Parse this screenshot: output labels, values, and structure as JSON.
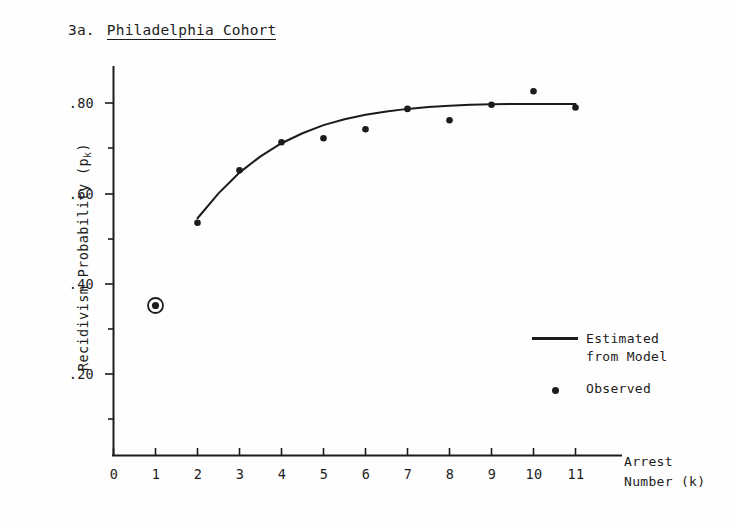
{
  "figure": {
    "number": "3a.",
    "name": "Philadelphia Cohort"
  },
  "axes": {
    "y_title_main": "Recidivism Probability (p",
    "y_title_sub": "k",
    "y_title_close": ")",
    "x_title_line1": "Arrest",
    "x_title_line2": "Number (k)"
  },
  "legend": {
    "estimated_label": "Estimated\nfrom Model",
    "observed_label": "Observed",
    "line_key": "line-swatch",
    "dot_key": "dot-swatch"
  },
  "chart_data": {
    "type": "scatter",
    "xlabel": "Arrest Number (k)",
    "ylabel": "Recidivism Probability (p_k)",
    "xlim": [
      0,
      11.6
    ],
    "ylim": [
      0,
      0.93
    ],
    "grid": false,
    "legend_position": "inside-lower-right",
    "xticks": [
      0,
      1,
      2,
      3,
      4,
      5,
      6,
      7,
      8,
      9,
      10,
      11
    ],
    "xtick_labels": [
      "0",
      "1",
      "2",
      "3",
      "4",
      "5",
      "6",
      "7",
      "8",
      "9",
      "10",
      "11"
    ],
    "yticks": [
      0.1,
      0.2,
      0.3,
      0.4,
      0.5,
      0.6,
      0.7,
      0.8,
      0.9
    ],
    "ytick_labels": [
      "",
      ".20",
      "",
      ".40",
      "",
      ".60",
      "",
      ".80",
      ""
    ],
    "series": [
      {
        "name": "Observed",
        "type": "scatter",
        "marker": "filled-circle",
        "color": "#1c1c1c",
        "x": [
          1,
          2,
          3,
          4,
          5,
          6,
          7,
          8,
          9,
          10,
          11
        ],
        "y": [
          0.352,
          0.535,
          0.651,
          0.713,
          0.722,
          0.742,
          0.787,
          0.762,
          0.796,
          0.826,
          0.79
        ],
        "highlighted_points": [
          {
            "x": 1,
            "y": 0.352,
            "marker": "circled-dot"
          }
        ]
      },
      {
        "name": "Estimated from Model",
        "type": "line",
        "color": "#1c1c1c",
        "x": [
          2,
          2.5,
          3,
          3.5,
          4,
          4.5,
          5,
          5.5,
          6,
          6.5,
          7,
          7.5,
          8,
          8.5,
          9,
          9.5,
          10,
          10.5,
          11
        ],
        "y": [
          0.545,
          0.6,
          0.646,
          0.682,
          0.711,
          0.733,
          0.751,
          0.764,
          0.774,
          0.781,
          0.787,
          0.791,
          0.794,
          0.796,
          0.797,
          0.798,
          0.798,
          0.798,
          0.798
        ]
      }
    ]
  }
}
